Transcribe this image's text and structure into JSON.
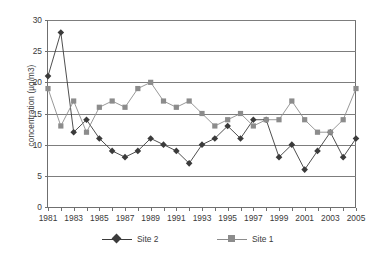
{
  "chart_data": {
    "type": "line",
    "title": "",
    "xlabel": "",
    "ylabel": "concentration (µg/m3)",
    "x": [
      1981,
      1982,
      1983,
      1984,
      1985,
      1986,
      1987,
      1988,
      1989,
      1990,
      1991,
      1992,
      1993,
      1994,
      1995,
      1996,
      1997,
      1998,
      1999,
      2000,
      2001,
      2002,
      2003,
      2004,
      2005
    ],
    "xtick_labels": [
      "1981",
      "",
      "1983",
      "",
      "1985",
      "",
      "1987",
      "",
      "1989",
      "",
      "1991",
      "",
      "1993",
      "",
      "1995",
      "",
      "1997",
      "",
      "1999",
      "",
      "2001",
      "",
      "2003",
      "",
      "2005"
    ],
    "ytick_labels": [
      "0",
      "5",
      "10",
      "15",
      "20",
      "25",
      "30"
    ],
    "yticks": [
      0,
      5,
      10,
      15,
      20,
      25,
      30
    ],
    "ylim": [
      0,
      30
    ],
    "xlim": [
      1981,
      2005
    ],
    "grid": "horizontal",
    "legend_position": "bottom",
    "series": [
      {
        "name": "Site 2",
        "marker": "diamond",
        "color": "#3b3b3b",
        "values": [
          21,
          28,
          12,
          14,
          11,
          9,
          8,
          9,
          11,
          10,
          9,
          7,
          10,
          11,
          13,
          11,
          14,
          14,
          8,
          10,
          6,
          9,
          12,
          8,
          11
        ]
      },
      {
        "name": "Site 1",
        "marker": "square",
        "color": "#8c8c8c",
        "values": [
          19,
          13,
          17,
          12,
          16,
          17,
          16,
          19,
          20,
          17,
          16,
          17,
          15,
          13,
          14,
          15,
          13,
          14,
          14,
          17,
          14,
          12,
          12,
          14,
          19
        ]
      }
    ]
  }
}
